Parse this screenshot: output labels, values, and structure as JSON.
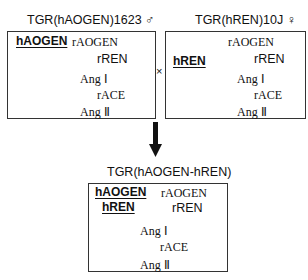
{
  "left_panel": {
    "title": "TGR(hAOGEN)1623 ♂",
    "transgene": "hAOGEN",
    "substrate": "rAOGEN",
    "enzyme1": "rREN",
    "product1": "Ang Ⅰ",
    "enzyme2": "rACE",
    "product2": "Ang Ⅱ"
  },
  "cross_symbol": "×",
  "right_panel": {
    "title": "TGR(hREN)10J ♀",
    "transgene": "hREN",
    "substrate": "rAOGEN",
    "enzyme1": "rREN",
    "product1": "Ang Ⅰ",
    "enzyme2": "rACE",
    "product2": "Ang Ⅱ"
  },
  "bottom_panel": {
    "title": "TGR(hAOGEN-hREN)",
    "transgene1": "hAOGEN",
    "transgene2": "hREN",
    "substrate": "rAOGEN",
    "enzyme1": "rREN",
    "product1": "Ang Ⅰ",
    "enzyme2": "rACE",
    "product2": "Ang Ⅱ"
  }
}
